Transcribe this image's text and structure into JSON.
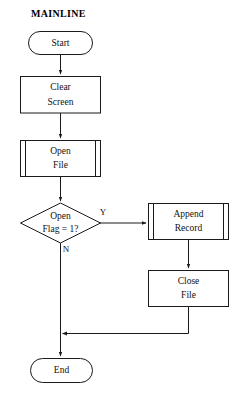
{
  "diagram": {
    "title": "MAINLINE",
    "type": "flowchart",
    "nodes": {
      "start": {
        "label": "Start",
        "shape": "terminator"
      },
      "clear_screen": {
        "label_line1": "Clear",
        "label_line2": "Screen",
        "shape": "process"
      },
      "open_file": {
        "label_line1": "Open",
        "label_line2": "File",
        "shape": "predefined-process"
      },
      "decision": {
        "label_line1": "Open",
        "label_line2": "Flag = 1?",
        "shape": "decision"
      },
      "append_record": {
        "label_line1": "Append",
        "label_line2": "Record",
        "shape": "predefined-process"
      },
      "close_file": {
        "label_line1": "Close",
        "label_line2": "File",
        "shape": "process"
      },
      "end": {
        "label": "End",
        "shape": "terminator"
      }
    },
    "edges": {
      "yes_label": "Y",
      "no_label": "N"
    },
    "colors": {
      "stroke": "#1a1a1a",
      "fill": "#ffffff",
      "text": "#111111",
      "background": "#ffffff"
    }
  }
}
